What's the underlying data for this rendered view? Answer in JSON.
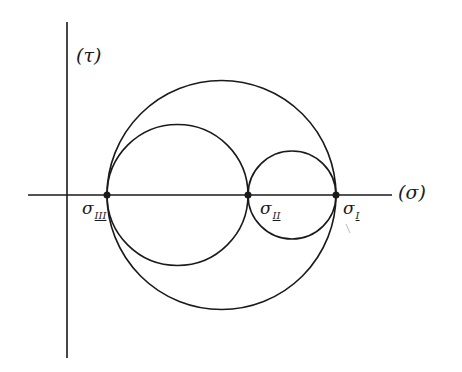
{
  "diagram": {
    "axes": {
      "vertical_label": "(τ)",
      "horizontal_label": "(σ)"
    },
    "points": [
      {
        "name": "sigma_III",
        "symbol": "σ",
        "subscript": "III",
        "x": 107
      },
      {
        "name": "sigma_II",
        "symbol": "σ",
        "subscript": "II",
        "x": 248
      },
      {
        "name": "sigma_I",
        "symbol": "σ",
        "subscript": "I",
        "x": 336
      }
    ],
    "circles": [
      {
        "name": "outer-circle",
        "between": "σIII–σI"
      },
      {
        "name": "left-circle",
        "between": "σIII–σII"
      },
      {
        "name": "right-circle",
        "between": "σII–σI"
      }
    ],
    "colors": {
      "stroke": "#1a1a1a",
      "background": "#ffffff"
    }
  }
}
